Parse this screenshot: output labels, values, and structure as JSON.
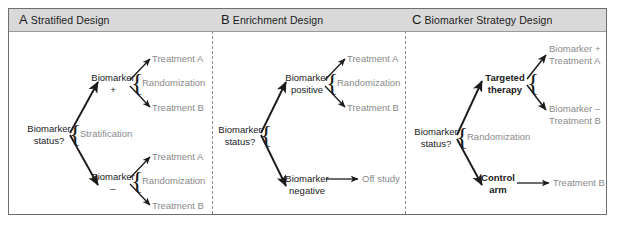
{
  "figure": {
    "background_color": "#ffffff",
    "frame_color": "#6e6e6e",
    "header_band_color": "#d9d9d9",
    "divider_color": "#8d8d8d",
    "node_text_color": "#1b1b1b",
    "leaf_text_color": "#8a8a8a",
    "arrow_color": "#1b1b1b"
  },
  "panels": [
    {
      "letter": "A",
      "title": "Stratified Design",
      "nodes": {
        "root": "Biomarker\nstatus?",
        "root_line1": "Biomarker",
        "root_line2": "status?",
        "split_label": "Stratification",
        "upper_line1": "Biomarker",
        "upper_line2": "+",
        "lower_line1": "Biomarker",
        "lower_line2": "–",
        "upper_randomization": "Randomization",
        "lower_randomization": "Randomization",
        "upper_arm_a": "Treatment A",
        "upper_arm_b": "Treatment B",
        "lower_arm_a": "Treatment A",
        "lower_arm_b": "Treatment B"
      }
    },
    {
      "letter": "B",
      "title": "Enrichment Design",
      "nodes": {
        "root_line1": "Biomarker",
        "root_line2": "status?",
        "upper_line1": "Biomarker",
        "upper_line2": "positive",
        "lower_line1": "Biomarker",
        "lower_line2": "negative",
        "upper_randomization": "Randomization",
        "upper_arm_a": "Treatment A",
        "upper_arm_b": "Treatment B",
        "lower_outcome": "Off study"
      }
    },
    {
      "letter": "C",
      "title": "Biomarker Strategy Design",
      "nodes": {
        "root_line1": "Biomarker",
        "root_line2": "status?",
        "split_label": "Randomization",
        "upper_line1": "Targeted",
        "upper_line2": "therapy",
        "lower_line1": "Control",
        "lower_line2": "arm",
        "upper_arm_a_line1": "Biomarker +",
        "upper_arm_a_line2": "Treatment A",
        "upper_arm_b_line1": "Biomarker –",
        "upper_arm_b_line2": "Treatment B",
        "lower_outcome": "Treatment B"
      }
    }
  ]
}
